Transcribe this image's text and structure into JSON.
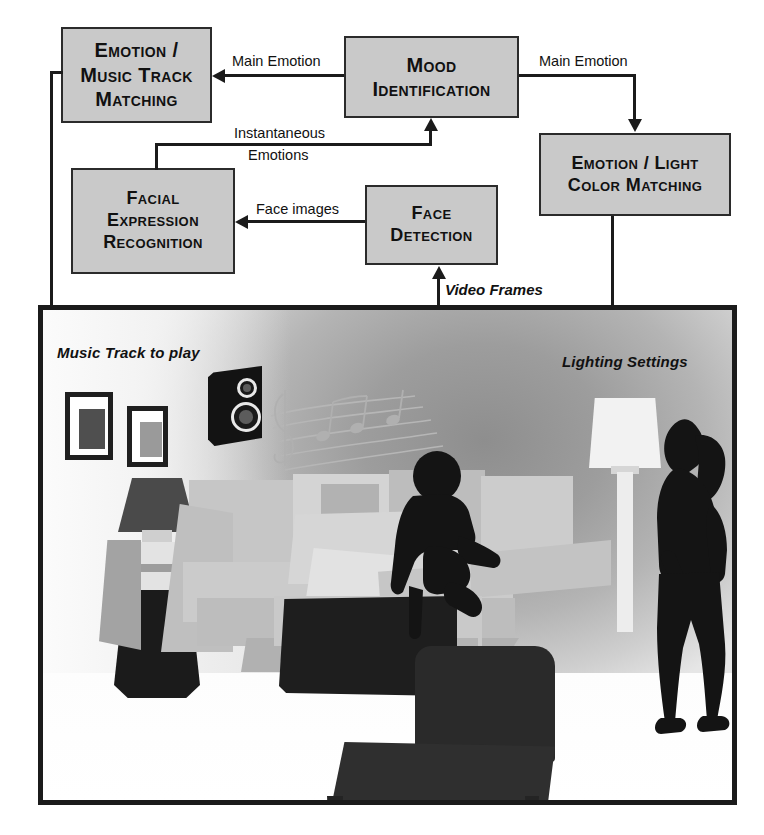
{
  "diagram": {
    "boxes": [
      {
        "id": "emotion_music",
        "lines": [
          "Emotion /",
          "Music Track",
          "Matching"
        ]
      },
      {
        "id": "mood_identification",
        "lines": [
          "Mood",
          "Identification"
        ]
      },
      {
        "id": "emotion_light",
        "lines": [
          "Emotion / Light",
          "Color Matching"
        ]
      },
      {
        "id": "facial_expression",
        "lines": [
          "Facial",
          "Expression",
          "Recognition"
        ]
      },
      {
        "id": "face_detection",
        "lines": [
          "Face",
          "Detection"
        ]
      }
    ],
    "edge_labels": {
      "main_emotion_left": "Main Emotion",
      "main_emotion_right": "Main Emotion",
      "instantaneous_line1": "Instantaneous",
      "instantaneous_line2": "Emotions",
      "face_images": "Face images",
      "video_frames": "Video Frames"
    }
  },
  "room": {
    "captions": {
      "music_track": "Music Track to play",
      "lighting_settings": "Lighting Settings"
    },
    "objects": {
      "speaker": "speaker",
      "music_notes": "music-notes",
      "camera": "dome-camera",
      "floor_lamp": "floor-lamp",
      "table_lamp": "table-lamp",
      "sectional_sofa": "sectional-sofa",
      "ottoman": "ottoman",
      "armchair": "armchair",
      "seated_man": "seated-man-silhouette",
      "standing_woman": "standing-woman-silhouette",
      "picture_frame_left": "picture-frame",
      "picture_frame_right": "picture-frame"
    }
  },
  "colors": {
    "box_fill": "#c9c9c9",
    "box_stroke": "#2b2b2b",
    "line": "#1b1b1b",
    "silhouette": "#151515",
    "sofa_light": "#cfcfcf",
    "sofa_mid": "#b9b9b9",
    "wall_dark": "#8e8e8e",
    "lamp_light": "#f4f4f4"
  }
}
